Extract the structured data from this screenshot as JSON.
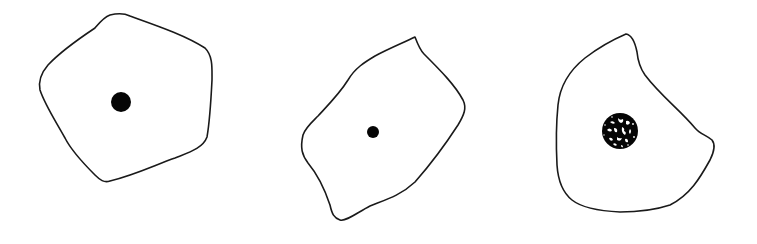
{
  "figure": {
    "background": "#ffffff",
    "stroke_color": "#1a1a1a",
    "nucleus_color": "#050505",
    "cells": [
      {
        "id": "cell-1",
        "shape": "rounded pentagon",
        "outline_path": "M110,15 C118,13 124,13 130,16 C155,25 185,35 205,48 C213,56 212,68 212,80 C211,100 210,120 207,137 C203,148 190,152 175,158 C155,165 135,175 110,181 C104,183 100,180 95,175 C80,160 70,148 65,138 C55,120 45,105 40,90 C38,80 42,72 48,65 C62,50 80,38 95,28 C100,22 104,17 110,15 Z",
        "nucleus": {
          "cx": 121,
          "cy": 102,
          "r": 10,
          "style": "solid"
        }
      },
      {
        "id": "cell-2",
        "shape": "tilted irregular quadrilateral",
        "outline_path": "M415,37 C418,45 420,50 424,54 C440,70 455,85 463,100 C467,108 464,115 458,125 C445,145 430,165 415,182 C400,196 385,200 370,206 C358,212 346,222 340,220 C334,218 332,214 330,205 C325,190 318,175 308,163 C302,155 300,148 303,135 C305,128 312,122 318,116 C330,103 340,93 348,80 C355,68 365,62 375,56 C390,48 405,42 415,37 Z",
        "nucleus": {
          "cx": 373,
          "cy": 132,
          "r": 6,
          "style": "solid"
        }
      },
      {
        "id": "cell-3",
        "shape": "irregular polygon with notch",
        "outline_path": "M626,34 C632,35 635,42 637,52 C638,62 640,68 645,75 C660,95 680,110 695,128 C700,134 706,135 712,140 C716,145 714,152 710,160 C700,178 690,195 670,205 C655,210 640,212 620,212 C600,211 582,208 572,200 C562,192 558,180 557,165 C556,145 556,125 558,105 C560,85 570,70 585,58 C598,48 612,40 626,34 Z",
        "nucleus": {
          "cx": 620,
          "cy": 131,
          "r": 18,
          "style": "speckled"
        }
      }
    ]
  }
}
